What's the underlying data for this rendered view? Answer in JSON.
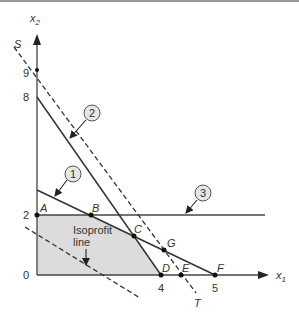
{
  "diagram": {
    "type": "linear-programming-graph",
    "axes": {
      "x_label": "x",
      "x_sub": "1",
      "y_label": "x",
      "y_sub": "2",
      "y_ticks": [
        "9",
        "8",
        "2",
        "0"
      ],
      "x_ticks": [
        "4",
        "5"
      ]
    },
    "points": {
      "A": "A",
      "B": "B",
      "C": "C",
      "D": "D",
      "E": "E",
      "F": "F",
      "G": "G"
    },
    "line_labels": {
      "S": "S",
      "T": "T"
    },
    "constraints": [
      {
        "id": "1",
        "label": "1"
      },
      {
        "id": "2",
        "label": "2"
      },
      {
        "id": "3",
        "label": "3"
      }
    ],
    "annotation": {
      "line1": "Isoprofit",
      "line2": "line"
    },
    "colors": {
      "feasible_region": "#dcdcdc",
      "line": "#333333",
      "circle_fill": "#e6e6e6"
    }
  }
}
